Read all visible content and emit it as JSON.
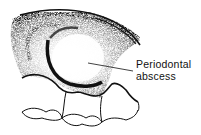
{
  "figure": {
    "label_line1": "Periodontal",
    "label_line2": "abscess",
    "colors": {
      "ink": "#111111",
      "background": "#ffffff",
      "stipple": "#555555"
    }
  }
}
